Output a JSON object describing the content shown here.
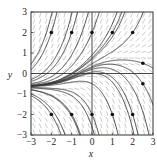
{
  "figure": {
    "type": "slope-field",
    "xlabel": "x",
    "ylabel": "y",
    "xlim": [
      -3,
      3
    ],
    "ylim": [
      -3,
      3
    ],
    "xticks": [
      "−3",
      "−2",
      "−1",
      "0",
      "1",
      "2",
      "3"
    ],
    "yticks": [
      "3",
      "2",
      "1",
      "0",
      "−1",
      "−2",
      "−3"
    ],
    "marked_points": [
      [
        -2,
        2
      ],
      [
        -1,
        2
      ],
      [
        0,
        2
      ],
      [
        1,
        2
      ],
      [
        2,
        2
      ],
      [
        2.5,
        0.5
      ],
      [
        2.5,
        -0.5
      ],
      [
        -2,
        -2
      ],
      [
        -1,
        -2
      ],
      [
        0,
        -2
      ],
      [
        1,
        -2
      ],
      [
        2,
        -2
      ]
    ],
    "extra_curve_starts": [
      [
        -3,
        0.45
      ],
      [
        -3,
        -0.3
      ],
      [
        -3,
        -0.5
      ],
      [
        -3,
        -0.7
      ],
      [
        -3,
        -0.8
      ],
      [
        -3,
        -1.0
      ],
      [
        0,
        0.9
      ],
      [
        0,
        0.7
      ],
      [
        0,
        0.2
      ],
      [
        0,
        0.0
      ]
    ],
    "colors": {
      "frame": "#333333",
      "curve": "#3a3a3a",
      "field": "#b8b8b8",
      "dot": "#111111"
    }
  }
}
